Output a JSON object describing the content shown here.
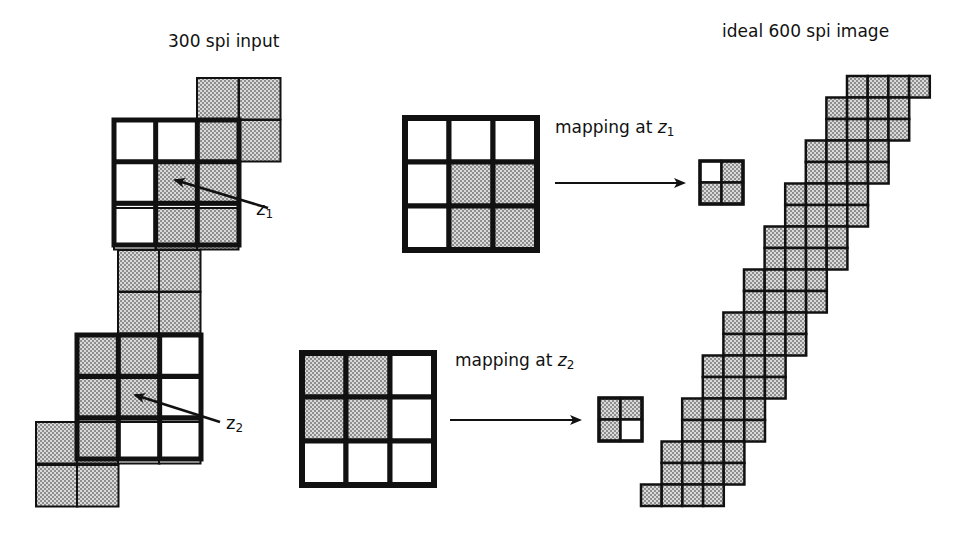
{
  "colors": {
    "ink": "#111111",
    "gray": "#c8c8c8",
    "white": "#ffffff"
  },
  "labels": {
    "input_title": "300 spi input",
    "output_title": "ideal 600 spi image",
    "mapping_z1": "mapping at ",
    "mapping_z2": "mapping at ",
    "z": "z",
    "sub1": "1",
    "sub2": "2"
  },
  "input_pixels": {
    "cell": 41.5,
    "cells": [
      [
        197,
        78,
        1
      ],
      [
        239,
        78,
        1
      ],
      [
        197,
        120,
        1
      ],
      [
        239,
        120,
        1
      ],
      [
        114,
        120,
        0
      ],
      [
        156,
        120,
        0
      ],
      [
        114,
        163,
        0
      ],
      [
        156,
        163,
        1
      ],
      [
        197,
        163,
        1
      ],
      [
        114,
        208,
        0
      ],
      [
        156,
        208,
        1
      ],
      [
        197,
        208,
        1
      ],
      [
        118,
        250,
        1
      ],
      [
        159,
        250,
        1
      ],
      [
        118,
        292,
        1
      ],
      [
        159,
        292,
        1
      ],
      [
        77,
        335,
        1
      ],
      [
        118,
        335,
        1
      ],
      [
        159,
        335,
        0
      ],
      [
        77,
        378,
        1
      ],
      [
        118,
        378,
        1
      ],
      [
        159,
        378,
        0
      ],
      [
        36,
        422,
        1
      ],
      [
        77,
        422,
        1
      ],
      [
        118,
        422,
        0
      ],
      [
        159,
        422,
        0
      ],
      [
        36,
        465,
        1
      ],
      [
        77,
        465,
        1
      ]
    ]
  },
  "windows": [
    {
      "name": "window-z1-source",
      "x": 114,
      "y": 120,
      "size": 125
    },
    {
      "name": "window-z2-source",
      "x": 77,
      "y": 335,
      "size": 124
    }
  ],
  "pointers": [
    {
      "name": "pointer-z1",
      "x1": 268,
      "y1": 208,
      "x2": 175,
      "y2": 180,
      "label_x": 256,
      "label_y": 198,
      "sub": "1"
    },
    {
      "name": "pointer-z2",
      "x1": 220,
      "y1": 422,
      "x2": 135,
      "y2": 395,
      "label_x": 228,
      "label_y": 413,
      "sub": "2"
    }
  ],
  "mappings": [
    {
      "name": "mapping-z1",
      "grid": {
        "x": 405,
        "y": 118,
        "cell": 44,
        "pattern": [
          [
            0,
            0,
            0
          ],
          [
            0,
            1,
            1
          ],
          [
            0,
            1,
            1
          ]
        ]
      },
      "arrow": {
        "x1": 555,
        "x2": 684,
        "y": 183
      },
      "label": {
        "x": 555,
        "y": 117,
        "sub": "1"
      },
      "result": {
        "x": 700,
        "y": 161,
        "cell": 21.5,
        "pattern": [
          [
            0,
            1
          ],
          [
            1,
            1
          ]
        ]
      }
    },
    {
      "name": "mapping-z2",
      "grid": {
        "x": 302,
        "y": 353,
        "cell": 44,
        "pattern": [
          [
            1,
            1,
            0
          ],
          [
            1,
            1,
            0
          ],
          [
            0,
            0,
            0
          ]
        ]
      },
      "arrow": {
        "x1": 450,
        "x2": 580,
        "y": 420
      },
      "label": {
        "x": 455,
        "y": 350,
        "sub": "2"
      },
      "result": {
        "x": 599,
        "y": 398,
        "cell": 21.5,
        "pattern": [
          [
            1,
            1
          ],
          [
            1,
            0
          ]
        ]
      }
    }
  ],
  "output_staircase": {
    "cell": 20.7,
    "top_y": 76,
    "rows": 20,
    "cells_per_row": 4,
    "top_x": 847,
    "step": 20.6
  }
}
